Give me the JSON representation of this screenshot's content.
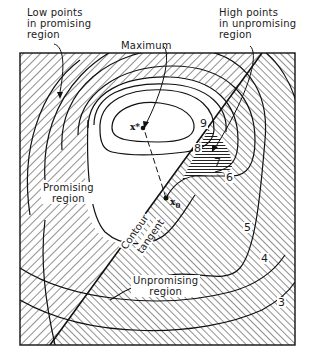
{
  "figure": {
    "annotations": {
      "low_points": [
        "Low points",
        "in promising",
        "region"
      ],
      "maximum": "Maximum",
      "high_points": [
        "High points",
        "in unpromising",
        "region"
      ],
      "promising_region": [
        "Promising",
        "region"
      ],
      "unpromising_region": [
        "Unpromising",
        "region"
      ],
      "contour_tangent": [
        "Contour",
        "tangent"
      ]
    },
    "points": {
      "maximum_point": "x*",
      "start_point": "x",
      "start_point_sub": "0"
    },
    "contour_levels": [
      "3",
      "4",
      "5",
      "6",
      "7",
      "8",
      "9"
    ],
    "colors": {
      "ink": "#1a1a1a",
      "paper": "#ffffff"
    }
  }
}
